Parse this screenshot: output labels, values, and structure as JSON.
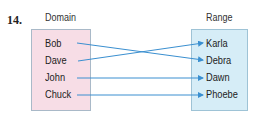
{
  "problem_number": "14.",
  "domain": {
    "title": "Domain",
    "items": [
      "Bob",
      "Dave",
      "John",
      "Chuck"
    ]
  },
  "range": {
    "title": "Range",
    "items": [
      "Karla",
      "Debra",
      "Dawn",
      "Phoebe"
    ]
  },
  "mapping": [
    {
      "from": "Bob",
      "to": "Debra"
    },
    {
      "from": "Dave",
      "to": "Karla"
    },
    {
      "from": "John",
      "to": "Dawn"
    },
    {
      "from": "Chuck",
      "to": "Phoebe"
    }
  ],
  "colors": {
    "arrow": "#3a8fd0",
    "domain_fill": "#f7dde6",
    "range_fill": "#d6edf7"
  }
}
